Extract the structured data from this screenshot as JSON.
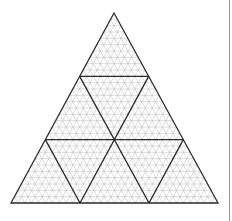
{
  "diagram": {
    "type": "triangular-grid",
    "outer_triangle": {
      "apex": [
        114,
        13
      ],
      "base_left": [
        11,
        203
      ],
      "base_right": [
        218,
        203
      ]
    },
    "major_divisions": 3,
    "minor_divisions_per_major": 10,
    "colors": {
      "background": "#ffffff",
      "major_line": "#2a2a2a",
      "minor_line": "#b8b8b8",
      "border": "#9a9a9a"
    },
    "line_widths": {
      "major": 1.3,
      "minor": 0.5
    }
  }
}
